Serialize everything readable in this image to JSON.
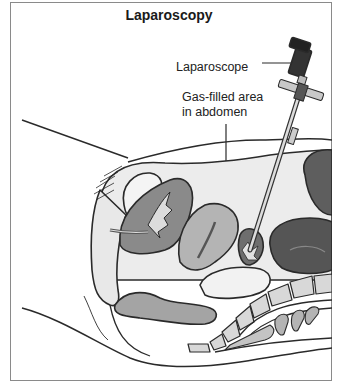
{
  "figure": {
    "title": "Laparoscopy",
    "labels": {
      "laparoscope": "Laparoscope",
      "gas_area_line1": "Gas-filled area",
      "gas_area_line2": "in abdomen"
    },
    "colors": {
      "frame": "#8a8a8a",
      "outline": "#2a2a2a",
      "light_fill": "#e4e4e4",
      "mid_fill": "#a8a8a8",
      "dark_fill": "#5a5a5a",
      "scope_dark": "#333333"
    }
  }
}
